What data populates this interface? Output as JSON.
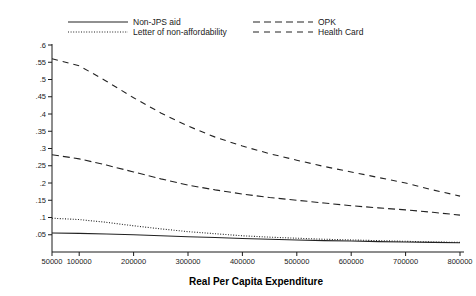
{
  "chart_data": {
    "type": "line",
    "title": "",
    "xlabel": "Real Per Capita Expenditure",
    "ylabel": "",
    "grid": false,
    "legend_position": "top",
    "xlim": [
      50000,
      800000
    ],
    "ylim": [
      0,
      0.6
    ],
    "xticks": [
      50000,
      100000,
      200000,
      300000,
      400000,
      500000,
      600000,
      700000,
      800000
    ],
    "xtick_labels": [
      "50000",
      "100000",
      "200000",
      "300000",
      "400000",
      "500000",
      "600000",
      "700000",
      "800000"
    ],
    "yticks": [
      0.05,
      0.1,
      0.15,
      0.2,
      0.25,
      0.3,
      0.35,
      0.4,
      0.45,
      0.5,
      0.55,
      0.6
    ],
    "ytick_labels": [
      ".05",
      ".1",
      ".15",
      ".2",
      ".25",
      ".3",
      ".35",
      ".4",
      ".45",
      ".5",
      ".55",
      ".6"
    ],
    "x": [
      50000,
      100000,
      150000,
      200000,
      250000,
      300000,
      350000,
      400000,
      450000,
      500000,
      550000,
      600000,
      650000,
      700000,
      750000,
      800000
    ],
    "series": [
      {
        "name": "Non-JPS aid",
        "style": "solid",
        "color": "#222222",
        "values": [
          0.055,
          0.054,
          0.052,
          0.05,
          0.047,
          0.044,
          0.042,
          0.039,
          0.037,
          0.035,
          0.033,
          0.032,
          0.03,
          0.029,
          0.028,
          0.027
        ]
      },
      {
        "name": "Letter of non-affordability",
        "style": "dotted",
        "color": "#222222",
        "values": [
          0.098,
          0.094,
          0.086,
          0.076,
          0.067,
          0.059,
          0.053,
          0.047,
          0.043,
          0.04,
          0.037,
          0.035,
          0.033,
          0.031,
          0.029,
          0.028
        ]
      },
      {
        "name": "OPK",
        "style": "long-dash",
        "color": "#222222",
        "values": [
          0.282,
          0.27,
          0.252,
          0.232,
          0.212,
          0.194,
          0.18,
          0.168,
          0.158,
          0.15,
          0.142,
          0.134,
          0.128,
          0.122,
          0.115,
          0.107
        ]
      },
      {
        "name": "Health Card",
        "style": "dash",
        "color": "#222222",
        "values": [
          0.56,
          0.54,
          0.495,
          0.447,
          0.403,
          0.365,
          0.333,
          0.307,
          0.285,
          0.266,
          0.248,
          0.232,
          0.216,
          0.2,
          0.18,
          0.162
        ]
      }
    ],
    "legend_entries": [
      {
        "label": "Non-JPS aid",
        "style": "solid"
      },
      {
        "label": "Letter of non-affordability",
        "style": "dotted"
      },
      {
        "label": "OPK",
        "style": "long-dash"
      },
      {
        "label": "Health Card",
        "style": "dash"
      }
    ]
  }
}
